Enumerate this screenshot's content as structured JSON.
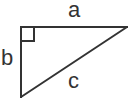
{
  "diagram": {
    "type": "right-triangle",
    "background": "#ffffff",
    "stroke_color": "#333333",
    "stroke_width": 2,
    "vertices": {
      "right_angle": [
        21,
        27
      ],
      "top_right": [
        127,
        27
      ],
      "bottom": [
        21,
        97
      ]
    },
    "right_angle_marker": {
      "x": 21,
      "y": 27,
      "size": 13
    },
    "labels": {
      "top_side": "a",
      "left_side": "b",
      "hypotenuse": "c"
    }
  }
}
